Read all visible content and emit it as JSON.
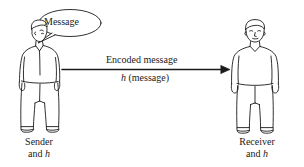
{
  "figure": {
    "background_color": "#ffffff",
    "ink_color": "#1a1a1a"
  },
  "speech_bubble": {
    "text": "Message"
  },
  "arrow": {
    "top_label": "Encoded message",
    "bottom_label_italic": "h",
    "bottom_label_rest": " (message)",
    "direction": "left-to-right"
  },
  "sender": {
    "caption_line1": "Sender",
    "caption_line2_prefix": "and ",
    "caption_line2_italic": "h"
  },
  "receiver": {
    "caption_line1": "Receiver",
    "caption_line2_prefix": "and ",
    "caption_line2_italic": "h"
  }
}
